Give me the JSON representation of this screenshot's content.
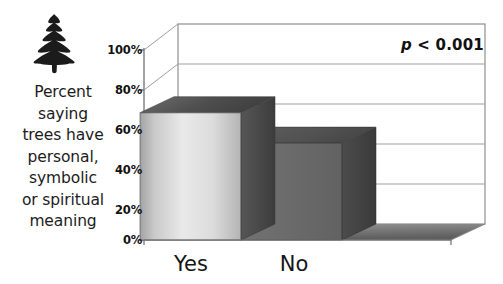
{
  "figure": {
    "icon": "pine-tree-icon",
    "caption_lines": [
      "Percent",
      "saying",
      "trees have",
      "personal,",
      "symbolic",
      "or spiritual",
      "meaning"
    ]
  },
  "chart_data": {
    "type": "bar",
    "title": "",
    "subtitle": "",
    "xlabel": "",
    "ylabel": "Percent saying trees have personal, symbolic or spiritual meaning",
    "categories": [
      "Yes",
      "No"
    ],
    "values": [
      67,
      51
    ],
    "value_labels": [
      "",
      ""
    ],
    "ytick_labels": [
      "100%",
      "80%",
      "60%",
      "40%",
      "20%",
      "0%"
    ],
    "ytick_values": [
      100,
      80,
      60,
      40,
      20,
      0
    ],
    "ylim": [
      0,
      100
    ],
    "grid": true,
    "grid_axis": "y",
    "legend": false,
    "legend_position": "none",
    "three_d": true,
    "annotations": [
      {
        "name": "p-value",
        "text_italic": "p",
        "text_rest": " < 0.001",
        "full_text": "p < 0.001",
        "position": "top-right"
      }
    ],
    "colors": {
      "bar_yes_front_light": "#e6e6e6",
      "bar_yes_front_dark": "#9a9a9a",
      "bar_yes_top": "#595959",
      "bar_yes_side": "#4a4a4a",
      "bar_no_front": "#6b6b6b",
      "bar_no_top": "#5a5a5a",
      "bar_no_side": "#434343",
      "floor": "#8a8a8a",
      "floor_dark": "#5d5d5d",
      "wall": "#ffffff",
      "gridline": "#9a9a9a",
      "axis": "#8c8c8c",
      "text": "#151515"
    }
  }
}
